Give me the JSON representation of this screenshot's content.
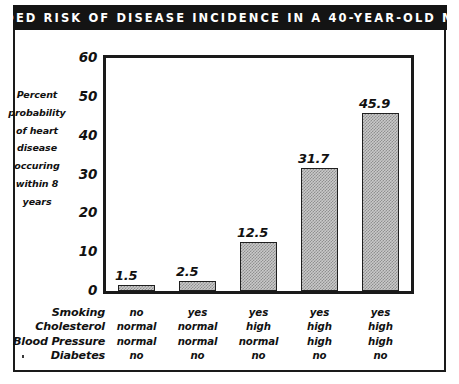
{
  "title": "ADDED RISK OF DISEASE INCIDENCE IN A 40-YEAR-OLD MAN",
  "chart_data": {
    "type": "bar",
    "title": "ADDED RISK OF DISEASE INCIDENCE IN A 40-YEAR-OLD MAN",
    "xlabel": "",
    "ylabel": "Percent probability of heart disease occuring within 8 years",
    "ylabel_lines": [
      "Percent",
      "probability",
      "of heart",
      "disease",
      "occuring",
      "within 8",
      "years"
    ],
    "ylim": [
      0,
      60
    ],
    "yticks": [
      60,
      50,
      40,
      30,
      20,
      10,
      0
    ],
    "ytick_labels": [
      "60",
      "50",
      "40",
      "30",
      "20",
      "10",
      "0"
    ],
    "grid": false,
    "legend": false,
    "categories": [
      "1",
      "2",
      "3",
      "4",
      "5"
    ],
    "values": [
      1.5,
      2.5,
      12.5,
      31.7,
      45.9
    ],
    "value_labels": [
      "1.5",
      "2.5",
      "12.5",
      "31.7",
      "45.9"
    ],
    "bar_fill": "#c9c9c9",
    "bar_edge": "#1f1f1f",
    "factor_rows": [
      {
        "label": "Smoking",
        "values": [
          "no",
          "yes",
          "yes",
          "yes",
          "yes"
        ]
      },
      {
        "label": "Cholesterol",
        "values": [
          "normal",
          "normal",
          "high",
          "high",
          "high"
        ]
      },
      {
        "label": "Blood Pressure",
        "values": [
          "normal",
          "normal",
          "normal",
          "high",
          "high"
        ]
      },
      {
        "label": "Diabetes",
        "values": [
          "no",
          "no",
          "no",
          "no",
          "no"
        ]
      }
    ]
  },
  "colors": {
    "ink": "#141414",
    "banner_bg": "#141414",
    "banner_text": "#ffffff",
    "plot_bg": "#ffffff",
    "bar_fill": "#c9c9c9",
    "bar_edge": "#1f1f1f"
  }
}
